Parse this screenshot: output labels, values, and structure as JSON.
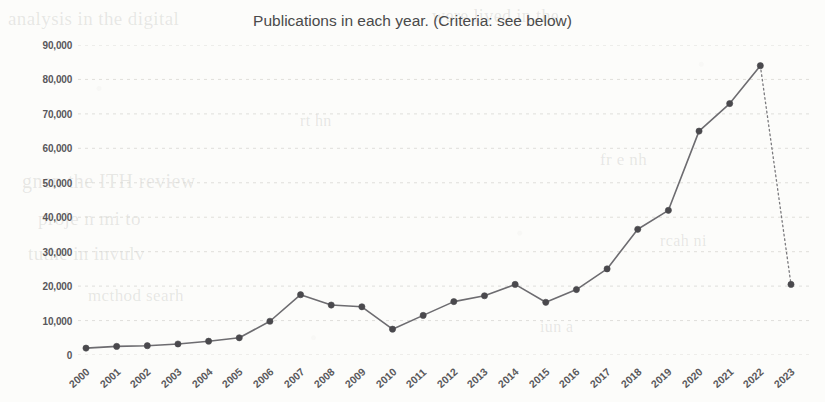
{
  "chart_data": {
    "type": "line",
    "title": "Publications in each year. (Criteria: see below)",
    "xlabel": "",
    "ylabel": "",
    "categories": [
      "2000",
      "2001",
      "2002",
      "2003",
      "2004",
      "2005",
      "2006",
      "2007",
      "2008",
      "2009",
      "2010",
      "2011",
      "2012",
      "2013",
      "2014",
      "2015",
      "2016",
      "2017",
      "2018",
      "2019",
      "2020",
      "2021",
      "2022",
      "2023"
    ],
    "values": [
      2000,
      2500,
      2700,
      3200,
      4000,
      5000,
      9800,
      17500,
      14500,
      14000,
      7500,
      11500,
      15500,
      17200,
      20500,
      15300,
      19000,
      25000,
      36500,
      42000,
      65000,
      73000,
      84000,
      20500
    ],
    "series": [
      {
        "name": "Publications",
        "values": [
          2000,
          2500,
          2700,
          3200,
          4000,
          5000,
          9800,
          17500,
          14500,
          14000,
          7500,
          11500,
          15500,
          17200,
          20500,
          15300,
          19000,
          25000,
          36500,
          42000,
          65000,
          73000,
          84000,
          20500
        ]
      }
    ],
    "ylim": [
      0,
      90000
    ],
    "yticks": [
      0,
      10000,
      20000,
      30000,
      40000,
      50000,
      60000,
      70000,
      80000,
      90000
    ],
    "ytick_labels": [
      "0",
      "10,000",
      "20,000",
      "30,000",
      "40,000",
      "50,000",
      "60,000",
      "70,000",
      "80,000",
      "90,000"
    ],
    "grid": true,
    "grid_axis": "y",
    "legend": false,
    "legend_position": "none",
    "marker": "circle",
    "line_color": "#6d6c70",
    "marker_color": "#4a494d",
    "grid_color": "#d8d7d3",
    "dashed_segment": {
      "from": "2022",
      "to": "2023",
      "style": "dotted",
      "note": "final segment drawn as a dotted line (partial-year data)"
    },
    "annotations": []
  },
  "page": {
    "background_texture": "scanned paper with faint reverse-side show-through",
    "bleed_text": {
      "b1": "analysis in the digital",
      "b2": "were lived in the",
      "b3": "gnen the ITH review",
      "b4": "proje n mi to",
      "b5": "tuthe in invulv",
      "b6": "mcthod searh",
      "b7": "fr e  nh",
      "b8": "rcah ni",
      "b9": "iun a",
      "b10": "rt hn"
    }
  }
}
